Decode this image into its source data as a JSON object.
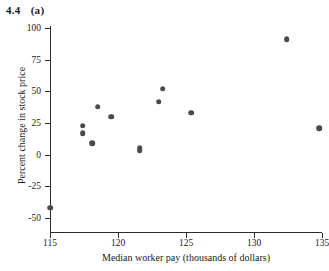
{
  "figure": {
    "number": "4.4",
    "part": "(a)"
  },
  "chart_data": {
    "type": "scatter",
    "title": "",
    "xlabel": "Median worker pay (thousands of dollars)",
    "ylabel": "Percent change in stock price",
    "xlim": [
      114.2,
      135.5
    ],
    "ylim": [
      -50,
      100
    ],
    "xticks": [
      115,
      120,
      125,
      130,
      135
    ],
    "xticklabels": [
      "115",
      "120",
      "125",
      "130",
      "135"
    ],
    "yticks": [
      100,
      75,
      50,
      25,
      0,
      -25,
      -50
    ],
    "yticklabels": [
      "100",
      "75",
      "50",
      "25",
      "0",
      "-25",
      "-50"
    ],
    "grid": false,
    "legend": null,
    "marker": {
      "shape": "circle",
      "color": "#4a4a4a",
      "size": 5.6
    },
    "points": [
      {
        "x": 115.0,
        "y": -42
      },
      {
        "x": 117.4,
        "y": 23
      },
      {
        "x": 117.4,
        "y": 17
      },
      {
        "x": 118.1,
        "y": 9
      },
      {
        "x": 118.5,
        "y": 38
      },
      {
        "x": 119.5,
        "y": 30
      },
      {
        "x": 121.6,
        "y": 5
      },
      {
        "x": 121.6,
        "y": 3
      },
      {
        "x": 123.3,
        "y": 52
      },
      {
        "x": 123.0,
        "y": 42
      },
      {
        "x": 125.4,
        "y": 33
      },
      {
        "x": 132.4,
        "y": 91
      },
      {
        "x": 134.8,
        "y": 21
      }
    ]
  }
}
